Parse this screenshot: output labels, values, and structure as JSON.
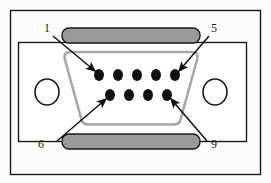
{
  "diagram": {
    "view": "face view with numbered pin callouts",
    "colors": {
      "page_background": "#fdfcfa",
      "outline": "#1a1a1a",
      "shell_fill": "#ffffff",
      "bar_fill": "#9a9a95",
      "bar_stroke": "#1a1a1a",
      "d_outline": "#a8a8a3",
      "pin_fill": "#111111",
      "label_text": "#1a1a1a",
      "arrow": "#111111"
    },
    "frame": {
      "name": "outer-border",
      "x": 10,
      "y": 10,
      "width": 251,
      "height": 165
    },
    "body": {
      "name": "connector-body-plate",
      "x": 18,
      "y": 42,
      "width": 229,
      "height": 100
    },
    "screw_holes": [
      {
        "id": "screw-hole-left",
        "cx": 47,
        "cy": 92,
        "rx": 12,
        "ry": 13
      },
      {
        "id": "screw-hole-right",
        "cx": 215,
        "cy": 92,
        "rx": 12,
        "ry": 13
      }
    ],
    "shield_bars": [
      {
        "id": "top-shield-bar",
        "x": 62,
        "y": 28,
        "width": 138,
        "height": 15,
        "radius": 7
      },
      {
        "id": "bottom-shield-bar",
        "x": 62,
        "y": 134,
        "width": 138,
        "height": 15,
        "radius": 7
      }
    ],
    "d_shell": {
      "name": "d-sub-shell-outline",
      "path": "M 70 52 L 192 52 Q 198 52 198 58 L 181 118 Q 180 124 174 124 L 88 124 Q 82 124 81 118 L 64 58 Q 64 52 70 52 Z"
    },
    "pins": {
      "top_row": {
        "label": "pins 1-5",
        "count": 5,
        "cy": 75,
        "x_positions": [
          99,
          118,
          137,
          156,
          175
        ],
        "rx": 5,
        "ry": 6
      },
      "bottom_row": {
        "label": "pins 6-9",
        "count": 4,
        "cy": 95,
        "x_positions": [
          110,
          129,
          148,
          167
        ],
        "rx": 5,
        "ry": 6
      }
    },
    "callouts": [
      {
        "id": "callout-pin-1",
        "label": "1",
        "label_x": 47,
        "label_y": 32,
        "line": {
          "x1": 53,
          "y1": 36,
          "x2": 97,
          "y2": 72
        },
        "arrow_at": "end",
        "points_to": "pin 1 (top row, leftmost)"
      },
      {
        "id": "callout-pin-5",
        "label": "5",
        "label_x": 212,
        "label_y": 32,
        "line": {
          "x1": 208,
          "y1": 36,
          "x2": 177,
          "y2": 72
        },
        "arrow_at": "end",
        "points_to": "pin 5 (top row, rightmost)"
      },
      {
        "id": "callout-pin-6",
        "label": "6",
        "label_x": 40,
        "label_y": 146,
        "line": {
          "x1": 58,
          "y1": 141,
          "x2": 108,
          "y2": 98
        },
        "arrow_at": "end",
        "points_to": "pin 6 (bottom row, leftmost)"
      },
      {
        "id": "callout-pin-9",
        "label": "9",
        "label_x": 212,
        "label_y": 146,
        "line": {
          "x1": 206,
          "y1": 141,
          "x2": 169,
          "y2": 98
        },
        "arrow_at": "end",
        "points_to": "pin 9 (bottom row, rightmost)"
      }
    ]
  }
}
